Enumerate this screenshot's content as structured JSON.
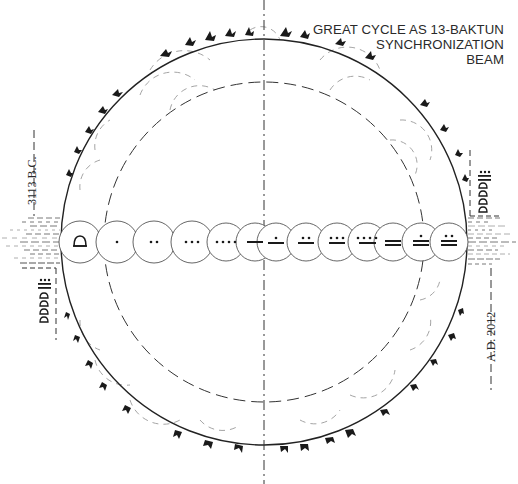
{
  "diagram": {
    "title_lines": [
      "GREAT CYCLE AS 13-BAKTUN",
      "SYNCHRONIZATION",
      "BEAM"
    ],
    "start_label": "3113 B.C.",
    "end_label": "A.D. 2012",
    "colors": {
      "ink": "#1a1a1a",
      "circle_stroke": "#333333",
      "faint_dash": "#9a9a9a",
      "background": "#ffffff"
    },
    "outer_circle": {
      "cx": 264,
      "cy": 242,
      "r": 203,
      "style": "solid"
    },
    "inner_circle": {
      "cx": 264,
      "cy": 242,
      "r": 160,
      "style": "dashed"
    },
    "vertical_axis": {
      "x": 264,
      "style": "dash-dot"
    },
    "beam": {
      "y": 242,
      "baktun_count": 13,
      "baktuns": [
        {
          "index": 0,
          "numeral": "shell (0 / 13)"
        },
        {
          "index": 1,
          "numeral": "1 dot"
        },
        {
          "index": 2,
          "numeral": "2 dots"
        },
        {
          "index": 3,
          "numeral": "3 dots"
        },
        {
          "index": 4,
          "numeral": "4 dots"
        },
        {
          "index": 5,
          "numeral": "1 bar"
        },
        {
          "index": 6,
          "numeral": "1 dot + 1 bar"
        },
        {
          "index": 7,
          "numeral": "2 dots + 1 bar"
        },
        {
          "index": 8,
          "numeral": "3 dots + 1 bar"
        },
        {
          "index": 9,
          "numeral": "4 dots + 1 bar"
        },
        {
          "index": 10,
          "numeral": "2 bars"
        },
        {
          "index": 11,
          "numeral": "1 dot + 2 bars"
        },
        {
          "index": 12,
          "numeral": "2 dots + 2 bars"
        }
      ]
    },
    "date_glyph_stacks": {
      "left": {
        "x": 44,
        "numeral": "3 dots + 2 bars",
        "shells": 4
      },
      "right": {
        "x": 484,
        "numeral": "3 dots + 2 bars",
        "shells": 4
      }
    }
  }
}
